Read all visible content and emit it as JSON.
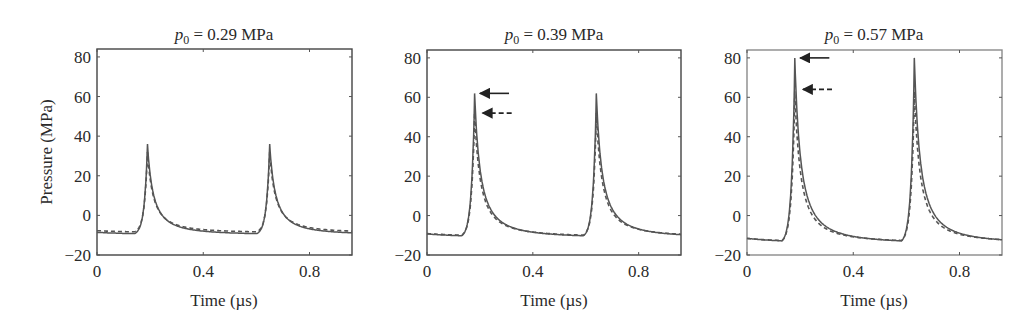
{
  "figure": {
    "ylabel": "Pressure (MPa)",
    "xlabel": "Time (µs)",
    "line_color": "#555555",
    "frame_color": "#444444",
    "arrow_color": "#222222"
  },
  "chart_data": [
    {
      "type": "line",
      "title_prefix": "p",
      "title_subscript": "0",
      "title_suffix": " = 0.29 MPa",
      "title": "p0 = 0.29 MPa",
      "xlabel": "Time (µs)",
      "ylabel": "Pressure (MPa)",
      "xlim": [
        0,
        0.96
      ],
      "ylim": [
        -20,
        84
      ],
      "xticks": [
        0,
        0.4,
        0.8
      ],
      "xtick_labels": [
        "0",
        "0.4",
        "0.8"
      ],
      "yticks": [
        -20,
        0,
        20,
        40,
        60,
        80
      ],
      "ytick_labels": [
        "−20",
        "0",
        "20",
        "40",
        "60",
        "80"
      ],
      "grid": false,
      "series": [
        {
          "name": "solid",
          "style": "solid",
          "peak_times": [
            0.19,
            0.65
          ],
          "peak_value": 36,
          "baseline": -9.5,
          "min_value": -10
        },
        {
          "name": "dashed",
          "style": "dashed",
          "peak_times": [
            0.19,
            0.65
          ],
          "peak_value": 32,
          "baseline": -9.5,
          "min_value": -9
        }
      ],
      "arrows": []
    },
    {
      "type": "line",
      "title_prefix": "p",
      "title_subscript": "0",
      "title_suffix": " = 0.39 MPa",
      "title": "p0 = 0.39 MPa",
      "xlabel": "Time (µs)",
      "ylabel": "",
      "xlim": [
        0,
        0.96
      ],
      "ylim": [
        -20,
        84
      ],
      "xticks": [
        0,
        0.4,
        0.8
      ],
      "xtick_labels": [
        "0",
        "0.4",
        "0.8"
      ],
      "yticks": [
        -20,
        0,
        20,
        40,
        60,
        80
      ],
      "ytick_labels": [
        "−20",
        "0",
        "20",
        "40",
        "60",
        "80"
      ],
      "grid": false,
      "series": [
        {
          "name": "solid",
          "style": "solid",
          "peak_times": [
            0.18,
            0.64
          ],
          "peak_value": 62,
          "baseline": -11,
          "min_value": -11.5
        },
        {
          "name": "dashed",
          "style": "dashed",
          "peak_times": [
            0.18,
            0.64
          ],
          "peak_value": 52,
          "baseline": -11,
          "min_value": -11
        }
      ],
      "arrows": [
        {
          "style": "solid",
          "y": 62,
          "x_from": 0.31,
          "x_to": 0.2
        },
        {
          "style": "dashed",
          "y": 52,
          "x_from": 0.32,
          "x_to": 0.21
        }
      ]
    },
    {
      "type": "line",
      "title_prefix": "p",
      "title_subscript": "0",
      "title_suffix": " = 0.57 MPa",
      "title": "p0 = 0.57 MPa",
      "xlabel": "Time (µs)",
      "ylabel": "",
      "xlim": [
        0,
        0.96
      ],
      "ylim": [
        -20,
        84
      ],
      "xticks": [
        0,
        0.4,
        0.8
      ],
      "xtick_labels": [
        "0",
        "0.4",
        "0.8"
      ],
      "yticks": [
        -20,
        0,
        20,
        40,
        60,
        80
      ],
      "ytick_labels": [
        "−20",
        "0",
        "20",
        "40",
        "60",
        "80"
      ],
      "grid": false,
      "series": [
        {
          "name": "solid",
          "style": "solid",
          "peak_times": [
            0.18,
            0.63
          ],
          "peak_value": 80,
          "baseline": -14,
          "min_value": -14.5
        },
        {
          "name": "dashed",
          "style": "dashed",
          "peak_times": [
            0.18,
            0.63
          ],
          "peak_value": 63,
          "baseline": -14,
          "min_value": -14
        }
      ],
      "arrows": [
        {
          "style": "solid",
          "y": 80,
          "x_from": 0.31,
          "x_to": 0.2
        },
        {
          "style": "dashed",
          "y": 64,
          "x_from": 0.32,
          "x_to": 0.21
        }
      ]
    }
  ]
}
